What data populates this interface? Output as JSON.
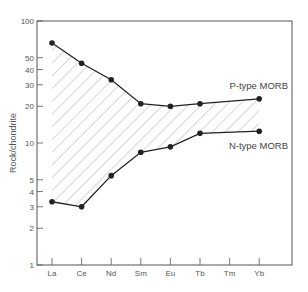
{
  "chart_data": {
    "type": "line",
    "title": "",
    "xlabel": "",
    "ylabel": "Rock/chondrite",
    "yscale": "log",
    "ylim": [
      1,
      100
    ],
    "categories": [
      "La",
      "Ce",
      "Nd",
      "Sm",
      "Eu",
      "Tb",
      "Tm",
      "Yb"
    ],
    "yticks": [
      1,
      2,
      3,
      4,
      5,
      10,
      20,
      30,
      40,
      50,
      100
    ],
    "series": [
      {
        "name": "P-type MORB",
        "values": [
          66,
          45,
          33,
          21,
          20,
          21,
          null,
          23
        ]
      },
      {
        "name": "N-type MORB",
        "values": [
          3.3,
          3.0,
          5.4,
          8.4,
          9.3,
          12,
          null,
          12.5
        ]
      }
    ],
    "annotations": [
      "Hatched field between P-type MORB and N-type MORB curves"
    ],
    "grid": false,
    "legend": "inline labels at right"
  },
  "labels": {
    "p_type": "P-type MORB",
    "n_type": "N-type MORB",
    "ylabel": "Rock/chondrite"
  }
}
